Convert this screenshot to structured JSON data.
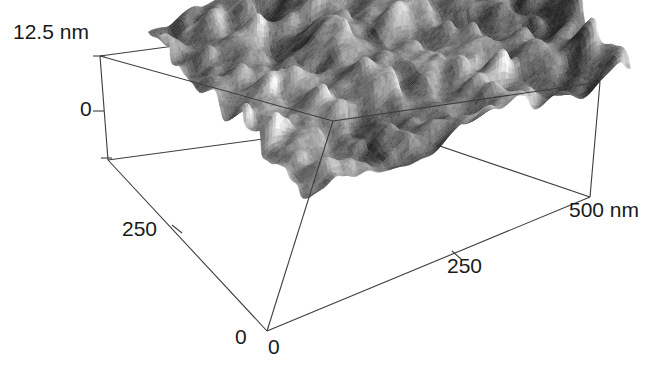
{
  "figure": {
    "background_color": "#ffffff",
    "line_color": "#3a3a3a"
  },
  "labels": {
    "z_max": "12.5 nm",
    "z_zero": "0",
    "y_mid": "250",
    "y_zero": "0",
    "x_zero": "0",
    "x_mid": "250",
    "x_max": "500 nm"
  },
  "chart_data": {
    "type": "heatmap",
    "title": "",
    "xlabel": "500 nm",
    "ylabel": "250",
    "zlabel": "12.5 nm",
    "projection": "3d-surface",
    "grid": false,
    "legend": null,
    "axes": {
      "x": {
        "label": "500 nm",
        "ticks": [
          0,
          250,
          500
        ],
        "ticklabels": [
          "0",
          "250",
          "500 nm"
        ],
        "range": [
          0,
          500
        ],
        "unit": "nm"
      },
      "y": {
        "label": "250",
        "ticks": [
          0,
          250,
          500
        ],
        "ticklabels": [
          "0",
          "250",
          ""
        ],
        "range": [
          0,
          500
        ],
        "unit": "nm"
      },
      "z": {
        "label": "12.5 nm",
        "ticks": [
          0,
          12.5
        ],
        "ticklabels": [
          "0",
          "12.5 nm"
        ],
        "range": [
          0,
          12.5
        ],
        "unit": "nm"
      }
    },
    "surface": {
      "description": "Granular nanostructured film surface, randomly packed grains",
      "colormap": "grayscale",
      "grain_diameter_nm": 35,
      "rms_roughness_nm": 2.1,
      "peak_to_valley_nm": 12.5,
      "value_min_nm": 0,
      "value_max_nm": 12.5,
      "value_mean_nm": 6.2,
      "samples": 256
    },
    "annotations": []
  }
}
